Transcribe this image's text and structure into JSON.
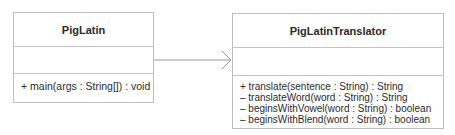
{
  "diagram": {
    "type": "UML class diagram",
    "classes": [
      {
        "name": "PigLatin",
        "attributes": [],
        "operations": [
          "+ main(args : String[]) : void"
        ]
      },
      {
        "name": "PigLatinTranslator",
        "attributes": [],
        "operations": [
          "+ translate(sentence : String) : String",
          "– translateWord(word : String) : String",
          "– beginsWithVowel(word : String) : boolean",
          "– beginsWithBlend(word : String) : boolean"
        ]
      }
    ],
    "relationships": [
      {
        "from": "PigLatin",
        "to": "PigLatinTranslator",
        "kind": "dependency-arrow",
        "arrowhead": "open"
      }
    ],
    "colors": {
      "border": "#bdbdbd",
      "text": "#2a2a2a",
      "arrow": "#9a9a9a"
    }
  }
}
